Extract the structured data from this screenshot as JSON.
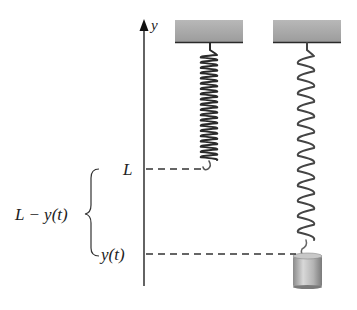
{
  "figure": {
    "axis": {
      "label": "y"
    },
    "labels": {
      "natural_length": "L",
      "position": "y(t)",
      "brace_label": "L − y(t)"
    },
    "left_spring": {
      "state": "unstretched",
      "coils": 20
    },
    "right_spring": {
      "state": "stretched",
      "coils": 12,
      "has_mass": true
    },
    "colors": {
      "ceiling": "#a8a8a8",
      "ceiling_edge": "#333333",
      "spring_left": "#2a2a2a",
      "spring_right": "#555555",
      "mass": "#b0b0b0",
      "axis": "#222222",
      "dashed": "#333333"
    }
  }
}
